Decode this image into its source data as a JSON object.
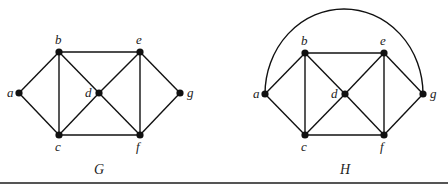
{
  "figure": {
    "graphs": [
      {
        "id": "G",
        "caption": "G",
        "caption_pos": [
          99,
          174
        ],
        "vertices": [
          {
            "name": "a",
            "x": 19,
            "y": 93,
            "label_dx": -12,
            "label_dy": 4
          },
          {
            "name": "b",
            "x": 59,
            "y": 52,
            "label_dx": -4,
            "label_dy": -8
          },
          {
            "name": "c",
            "x": 59,
            "y": 135,
            "label_dx": -4,
            "label_dy": 16
          },
          {
            "name": "d",
            "x": 99,
            "y": 93,
            "label_dx": -14,
            "label_dy": 4
          },
          {
            "name": "e",
            "x": 140,
            "y": 52,
            "label_dx": -4,
            "label_dy": -8
          },
          {
            "name": "f",
            "x": 140,
            "y": 135,
            "label_dx": -4,
            "label_dy": 16
          },
          {
            "name": "g",
            "x": 180,
            "y": 93,
            "label_dx": 7,
            "label_dy": 4
          }
        ],
        "edges": [
          [
            "a",
            "b"
          ],
          [
            "a",
            "c"
          ],
          [
            "b",
            "c"
          ],
          [
            "b",
            "e"
          ],
          [
            "b",
            "d"
          ],
          [
            "c",
            "d"
          ],
          [
            "c",
            "f"
          ],
          [
            "d",
            "e"
          ],
          [
            "d",
            "f"
          ],
          [
            "e",
            "f"
          ],
          [
            "e",
            "g"
          ],
          [
            "f",
            "g"
          ]
        ],
        "arcs": []
      },
      {
        "id": "H",
        "caption": "H",
        "caption_pos": [
          345,
          174
        ],
        "vertices": [
          {
            "name": "a",
            "x": 265,
            "y": 94,
            "label_dx": -12,
            "label_dy": 4
          },
          {
            "name": "b",
            "x": 305,
            "y": 53,
            "label_dx": -4,
            "label_dy": -8
          },
          {
            "name": "c",
            "x": 305,
            "y": 135,
            "label_dx": -4,
            "label_dy": 16
          },
          {
            "name": "d",
            "x": 345,
            "y": 94,
            "label_dx": -14,
            "label_dy": 4
          },
          {
            "name": "e",
            "x": 384,
            "y": 53,
            "label_dx": -4,
            "label_dy": -8
          },
          {
            "name": "f",
            "x": 384,
            "y": 135,
            "label_dx": -4,
            "label_dy": 16
          },
          {
            "name": "g",
            "x": 423,
            "y": 94,
            "label_dx": 7,
            "label_dy": 4
          }
        ],
        "edges": [
          [
            "a",
            "b"
          ],
          [
            "a",
            "c"
          ],
          [
            "b",
            "c"
          ],
          [
            "b",
            "e"
          ],
          [
            "b",
            "d"
          ],
          [
            "c",
            "d"
          ],
          [
            "c",
            "f"
          ],
          [
            "d",
            "e"
          ],
          [
            "d",
            "f"
          ],
          [
            "e",
            "f"
          ],
          [
            "e",
            "g"
          ],
          [
            "f",
            "g"
          ]
        ],
        "arcs": [
          {
            "from": "a",
            "to": "g",
            "rx": 79,
            "ry": 85
          }
        ]
      }
    ]
  }
}
